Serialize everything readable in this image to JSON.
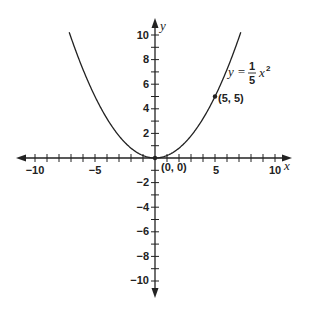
{
  "chart_data": {
    "type": "line",
    "title": "",
    "xlabel": "x",
    "ylabel": "y",
    "xlim": [
      -10.5,
      11
    ],
    "ylim": [
      -11,
      11
    ],
    "grid": false,
    "x_ticks": [
      -10,
      -5,
      5,
      10
    ],
    "y_ticks": [
      -10,
      -8,
      -6,
      -4,
      -2,
      2,
      4,
      6,
      8,
      10
    ],
    "series": [
      {
        "name": "y = 1/5 x^2",
        "equation": "y = (1/5) x^2",
        "x": [
          -7,
          -6,
          -5,
          -4,
          -3,
          -2,
          -1,
          0,
          1,
          2,
          3,
          4,
          5,
          6,
          7
        ],
        "values": [
          9.8,
          7.2,
          5,
          3.2,
          1.8,
          0.8,
          0.2,
          0,
          0.2,
          0.8,
          1.8,
          3.2,
          5,
          7.2,
          9.8
        ]
      }
    ],
    "points": [
      {
        "label": "(0, 0)",
        "x": 0,
        "y": 0
      },
      {
        "label": "(5, 5)",
        "x": 5,
        "y": 5
      }
    ],
    "annotations": {
      "equation_lhs": "y =",
      "equation_num": "1",
      "equation_den": "5",
      "equation_var": "x",
      "equation_exp": "2"
    }
  },
  "labels": {
    "x_axis": "x",
    "y_axis": "y",
    "x_ticks": [
      "−10",
      "−5",
      "5",
      "10"
    ],
    "y_ticks_pos": [
      "10",
      "8",
      "6",
      "4",
      "2"
    ],
    "y_ticks_neg": [
      "−2",
      "−4",
      "−6",
      "−8",
      "−10"
    ],
    "origin_label": "(0, 0)",
    "point_label": "(5, 5)"
  }
}
